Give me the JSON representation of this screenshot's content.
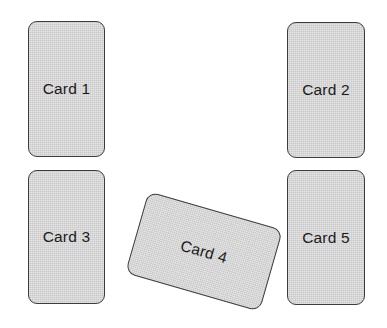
{
  "canvas": {
    "width": 387,
    "height": 328,
    "background_color": "#ffffff"
  },
  "style": {
    "card_fill_color": "#c9c9c9",
    "card_border_color": "#3c3c3c",
    "label_text_color": "#1b1b1b"
  },
  "cards": [
    {
      "id": "card-1",
      "label": "Card 1",
      "x": 28,
      "y": 21,
      "width": 77,
      "height": 136,
      "rotation_degrees": 0
    },
    {
      "id": "card-2",
      "label": "Card 2",
      "x": 287,
      "y": 22,
      "width": 78,
      "height": 136,
      "rotation_degrees": 0
    },
    {
      "id": "card-3",
      "label": "Card 3",
      "x": 28,
      "y": 170,
      "width": 77,
      "height": 134,
      "rotation_degrees": 0
    },
    {
      "id": "card-4",
      "label": "Card 4",
      "x": 134,
      "y": 209,
      "width": 140,
      "height": 85,
      "rotation_degrees": 16
    },
    {
      "id": "card-5",
      "label": "Card 5",
      "x": 287,
      "y": 170,
      "width": 78,
      "height": 135,
      "rotation_degrees": 0
    }
  ]
}
